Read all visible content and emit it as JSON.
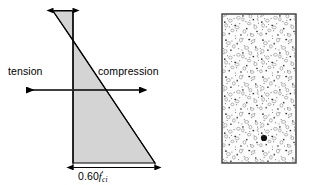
{
  "figure": {
    "name": "prestressed-concrete-stress-distribution",
    "labels": {
      "tension": "tension",
      "compression": "compression",
      "stress_value": "0.60",
      "stress_symbol": "f",
      "stress_prime": "′",
      "stress_subscript": "ci"
    },
    "colors": {
      "stress_block_fill": "#d4d4d4",
      "outline": "#000000",
      "section_fill": "#fcfcfc",
      "section_border": "#3a3a3a",
      "aggregate_dark": "#1a1a1a",
      "aggregate_mid": "#6e6e6e",
      "aggregate_light": "#a8a8a8"
    },
    "geometry": {
      "neutral_axis_y": 40,
      "section_top_y": 14,
      "section_bottom_y": 163,
      "diagram_axis_x": 73,
      "tension_apex_x": 52,
      "compression_extent_x": 155
    }
  },
  "stress_diagram": {
    "name": "stress-block",
    "tension_zone": {
      "label": "tension",
      "arrow_direction": "left",
      "arrow_y": 90,
      "arrow_from_x": 73,
      "arrow_to_x": 25
    },
    "compression_zone": {
      "label": "compression",
      "arrow_direction": "right",
      "arrow_y": 90,
      "arrow_from_x": 73,
      "arrow_to_x": 141
    },
    "top_dimension": {
      "name": "tension-stress-dimension",
      "y": 11,
      "from_x": 53,
      "to_x": 73
    },
    "bottom_dimension": {
      "name": "compression-stress-dimension",
      "y": 168,
      "from_x": 73,
      "to_x": 155
    }
  },
  "cross_section": {
    "name": "concrete-cross-section",
    "x": 222,
    "y": 14,
    "width": 74,
    "height": 149,
    "hatch": "concrete-aggregate-stipple"
  }
}
